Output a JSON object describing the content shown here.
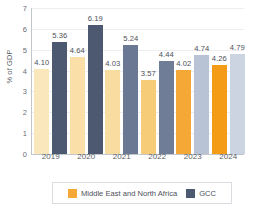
{
  "chart_data": {
    "type": "bar",
    "title": "",
    "xlabel": "",
    "ylabel": "% of GDP",
    "ylim": [
      0,
      7
    ],
    "yticks": [
      "7",
      "6",
      "5",
      "4",
      "3",
      "2",
      "1",
      "0"
    ],
    "grid": true,
    "legend_position": "bottom",
    "categories": [
      "2019",
      "2020",
      "2021",
      "2022",
      "2023",
      "2024"
    ],
    "series": [
      {
        "name": "Middle East and North Africa",
        "color": "#f5a836",
        "values": [
          4.1,
          4.64,
          4.03,
          3.57,
          4.02,
          4.26
        ],
        "labels": [
          "4.10",
          "4.64",
          "4.03",
          "3.57",
          "4.02",
          "4.26"
        ],
        "bar_colors": [
          "#fae7bb",
          "#fae0a8",
          "#f9dda0",
          "#f6cc78",
          "#f5a836",
          "#f49b18"
        ]
      },
      {
        "name": "GCC",
        "color": "#4d5971",
        "values": [
          5.36,
          6.19,
          5.24,
          4.44,
          4.74,
          4.79
        ],
        "labels": [
          "5.36",
          "6.19",
          "5.24",
          "4.44",
          "4.74",
          "4.79"
        ],
        "bar_colors": [
          "#4d5971",
          "#4d5971",
          "#6b7893",
          "#707d97",
          "#b9c3d6",
          "#ccd4e2"
        ]
      }
    ]
  },
  "legend": {
    "items": [
      {
        "label": "Middle East and North Africa",
        "color": "#f5a836"
      },
      {
        "label": "GCC",
        "color": "#4d5971"
      }
    ]
  }
}
